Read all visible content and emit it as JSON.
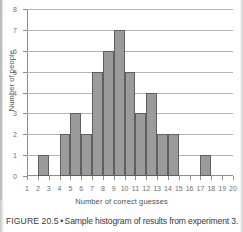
{
  "figure": {
    "caption_label": "FIGURE 20.5",
    "caption_separator": "•",
    "caption_text": "Sample histogram of results from experiment 3."
  },
  "chart_data": {
    "type": "bar",
    "title": "",
    "xlabel": "Number of correct guesses",
    "ylabel": "Number of people",
    "xlim": [
      1,
      20
    ],
    "ylim": [
      0,
      8
    ],
    "grid": true,
    "legend": null,
    "xtick_labels": [
      "1",
      "2",
      "3",
      "4",
      "5",
      "6",
      "7",
      "8",
      "9",
      "10",
      "11",
      "12",
      "13",
      "14",
      "15",
      "16",
      "17",
      "18",
      "19",
      "20"
    ],
    "ytick_labels": [
      "0",
      "1",
      "2",
      "3",
      "4",
      "5",
      "6",
      "7",
      "8"
    ],
    "bin_edges": [
      1,
      2,
      3,
      4,
      5,
      6,
      7,
      8,
      9,
      10,
      11,
      12,
      13,
      14,
      15,
      16,
      17,
      18,
      19,
      20
    ],
    "categories": [
      "1-2",
      "2-3",
      "3-4",
      "4-5",
      "5-6",
      "6-7",
      "7-8",
      "8-9",
      "9-10",
      "10-11",
      "11-12",
      "12-13",
      "13-14",
      "14-15",
      "15-16",
      "16-17",
      "17-18",
      "18-19",
      "19-20"
    ],
    "values": [
      0,
      1,
      0,
      2,
      3,
      2,
      5,
      6,
      7,
      5,
      3,
      4,
      2,
      2,
      0,
      0,
      1,
      0,
      0
    ],
    "bar_color": "#9b9b9b",
    "bar_edge_color": "#5f5f5f",
    "grid_color": "#b4b4b4",
    "axis_color": "#8d8d8d"
  }
}
